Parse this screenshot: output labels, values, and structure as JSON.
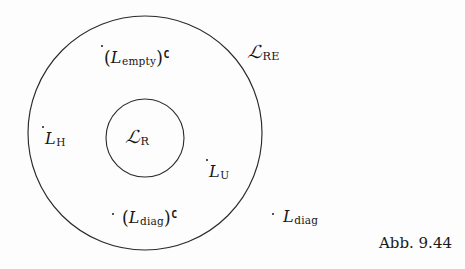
{
  "figure": {
    "kind": "venn-diagram",
    "caption": "Abb. 9.44",
    "background_color": "#fdfdfd",
    "stroke_color": "#2a2a2a",
    "text_color": "#161616"
  },
  "circles": [
    {
      "name": "outer-circle",
      "label": "L_RE",
      "cx": 145,
      "cy": 133,
      "r": 117
    },
    {
      "name": "inner-circle",
      "label": "L_R",
      "cx": 145,
      "cy": 138,
      "r": 39
    }
  ],
  "labels": {
    "outer_set": {
      "L": "ℒ",
      "sub": "RE",
      "plain": "L_RE",
      "x": 248,
      "y": 44
    },
    "inner_set": {
      "L": "ℒ",
      "sub": "R",
      "plain": "L_R",
      "x": 126,
      "y": 129
    }
  },
  "points": [
    {
      "name": "point-l-empty-complement",
      "plain": "(L_empty)^C",
      "open_paren": "(",
      "L": "L",
      "sub": "empty",
      "close_paren": ")",
      "sup": "C",
      "dot_x": 101,
      "dot_y": 45,
      "label_x": 104,
      "label_y": 49
    },
    {
      "name": "point-l-h",
      "plain": "L_H",
      "L": "L",
      "sub": "H",
      "dot_x": 42,
      "dot_y": 126,
      "label_x": 45,
      "label_y": 131
    },
    {
      "name": "point-l-u",
      "plain": "L_U",
      "L": "L",
      "sub": "U",
      "dot_x": 206,
      "dot_y": 159,
      "label_x": 209,
      "label_y": 164
    },
    {
      "name": "point-l-diag-complement",
      "plain": "(L_diag)^C",
      "open_paren": "(",
      "L": "L",
      "sub": "diag",
      "close_paren": ")",
      "sup": "C",
      "dot_x": 112,
      "dot_y": 213,
      "label_x": 122,
      "label_y": 209
    },
    {
      "name": "point-l-diag",
      "plain": "L_diag",
      "L": "L",
      "sub": "diag",
      "dot_x": 272,
      "dot_y": 213,
      "label_x": 283,
      "label_y": 209
    }
  ],
  "caption": {
    "text": "Abb. 9.44",
    "x": 379,
    "y": 236
  }
}
